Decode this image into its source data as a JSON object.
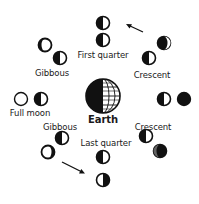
{
  "diagram": {
    "title": "",
    "center": {
      "label": "Earth",
      "icon": "earth-globe-icon"
    },
    "labels": {
      "first_quarter": "First quarter",
      "last_quarter": "Last quarter",
      "full_moon": "Full moon",
      "gibbous_top": "Gibbous",
      "gibbous_bottom": "Gibbous",
      "crescent_top": "Crescent",
      "crescent_bottom": "Crescent",
      "earth": "Earth"
    },
    "phases": [
      {
        "name": "New moon",
        "orbit_position": "right",
        "appearance": "dark"
      },
      {
        "name": "Crescent",
        "orbit_position": "upper-right",
        "appearance": "waxing crescent"
      },
      {
        "name": "First quarter",
        "orbit_position": "top",
        "appearance": "half lit right"
      },
      {
        "name": "Gibbous",
        "orbit_position": "upper-left",
        "appearance": "waxing gibbous"
      },
      {
        "name": "Full moon",
        "orbit_position": "left",
        "appearance": "fully lit"
      },
      {
        "name": "Gibbous",
        "orbit_position": "lower-left",
        "appearance": "waning gibbous"
      },
      {
        "name": "Last quarter",
        "orbit_position": "bottom",
        "appearance": "half lit left"
      },
      {
        "name": "Crescent",
        "orbit_position": "lower-right",
        "appearance": "waning crescent"
      }
    ],
    "arrows": [
      {
        "name": "orbit-direction-arrow-top",
        "direction": "up-left"
      },
      {
        "name": "orbit-direction-arrow-bottom",
        "direction": "down-right"
      }
    ],
    "colors": {
      "ink": "#111111",
      "paper": "#ffffff"
    }
  }
}
